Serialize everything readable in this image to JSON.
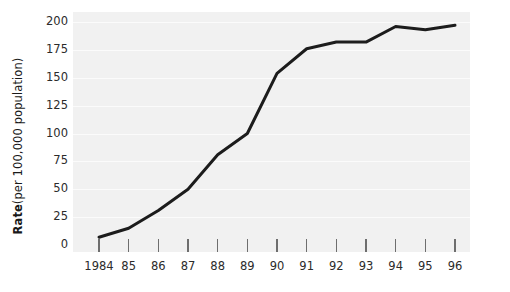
{
  "chart_data": {
    "type": "line",
    "title": "",
    "xlabel": "",
    "ylabel": "Rate (per 100,000 population)",
    "ylabel_bold_prefix": "Rate",
    "ylabel_rest": " (per 100,000 population)",
    "categories": [
      "1984",
      "85",
      "86",
      "87",
      "88",
      "89",
      "90",
      "91",
      "92",
      "93",
      "94",
      "95",
      "96"
    ],
    "values": [
      7,
      15,
      31,
      50,
      81,
      100,
      154,
      176,
      182,
      182,
      196,
      193,
      197
    ],
    "series": [
      {
        "name": "Rate",
        "values": [
          7,
          15,
          31,
          50,
          81,
          100,
          154,
          176,
          182,
          182,
          196,
          193,
          197
        ]
      }
    ],
    "ylim": [
      0,
      200
    ],
    "yticks": [
      0,
      25,
      50,
      75,
      100,
      125,
      150,
      175,
      200
    ],
    "ytick_labels": [
      "0",
      "25",
      "50",
      "75",
      "100",
      "125",
      "150",
      "175",
      "200"
    ],
    "xtick_labels": [
      "1984",
      "85",
      "86",
      "87",
      "88",
      "89",
      "90",
      "91",
      "92",
      "93",
      "94",
      "95",
      "96"
    ],
    "grid": "horizontal",
    "legend": "none",
    "line_color": "#1c1c1c",
    "line_width": 3,
    "plot_background": "#f1f1f1",
    "gridline_color": "#fbfbfb",
    "figure_background": "#ffffff",
    "markers": "none",
    "annotations": []
  }
}
